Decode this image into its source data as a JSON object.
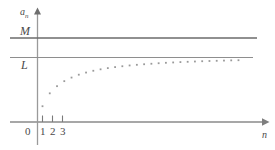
{
  "figure": {
    "title": "",
    "background_color": "#ffffff",
    "line_color": "#6b6b6b",
    "axis_color": "#8a8a8a",
    "dot_color": "#9a9a9a",
    "text_color": "#4a4a4a"
  },
  "labels": {
    "y_axis": "a",
    "y_axis_sub": "n",
    "x_axis": "n",
    "origin": "0",
    "upper_bound": "M",
    "limit": "L"
  },
  "ticks": {
    "x": [
      "1",
      "2",
      "3"
    ]
  },
  "chart_data": {
    "type": "scatter",
    "title": "",
    "xlabel": "n",
    "ylabel": "a_n",
    "grid": false,
    "legend": null,
    "xlim": [
      0,
      30
    ],
    "ylim": [
      0,
      1.35
    ],
    "annotations": [
      {
        "label": "M",
        "type": "horizontal-line",
        "y": 1.17,
        "note": "upper bound"
      },
      {
        "label": "L",
        "type": "horizontal-line",
        "y": 0.9,
        "note": "limit of the sequence"
      }
    ],
    "series": [
      {
        "name": "a_n",
        "marker": "dot",
        "x": [
          1,
          2,
          3,
          4,
          5,
          6,
          7,
          8,
          9,
          10,
          11,
          12,
          13,
          14,
          15,
          16,
          17,
          18,
          19,
          20,
          21,
          22,
          23,
          24,
          25,
          26,
          27,
          28
        ],
        "values": [
          0.22,
          0.4,
          0.5,
          0.57,
          0.62,
          0.66,
          0.69,
          0.715,
          0.735,
          0.752,
          0.766,
          0.778,
          0.789,
          0.798,
          0.806,
          0.813,
          0.82,
          0.826,
          0.831,
          0.836,
          0.84,
          0.844,
          0.848,
          0.851,
          0.854,
          0.857,
          0.86,
          0.862
        ]
      }
    ]
  }
}
